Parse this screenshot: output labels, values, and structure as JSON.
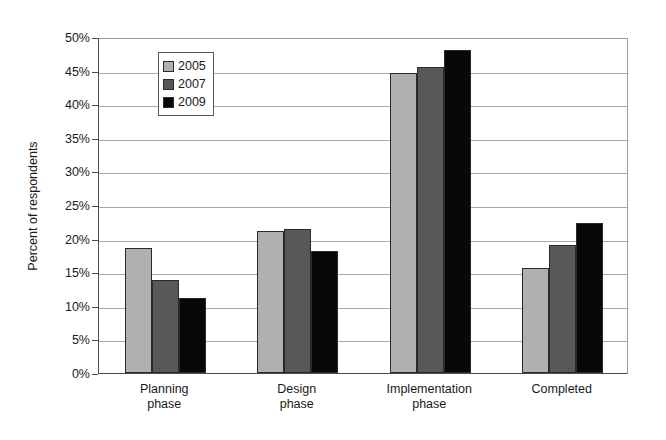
{
  "chart_data": {
    "type": "bar",
    "title": "",
    "xlabel": "",
    "ylabel": "Percent of respondents",
    "categories": [
      "Planning phase",
      "Design phase",
      "Implementation phase",
      "Completed"
    ],
    "category_lines": [
      [
        "Planning",
        "phase"
      ],
      [
        "Design",
        "phase"
      ],
      [
        "Implementation",
        "phase"
      ],
      [
        "Completed",
        ""
      ]
    ],
    "series": [
      {
        "name": "2005",
        "color": "#b0b0b0",
        "values": [
          18.6,
          21.1,
          44.6,
          15.6
        ]
      },
      {
        "name": "2007",
        "color": "#585858",
        "values": [
          13.8,
          21.4,
          45.5,
          19.1
        ]
      },
      {
        "name": "2009",
        "color": "#080808",
        "values": [
          11.2,
          18.2,
          48.0,
          22.3
        ]
      }
    ],
    "ylim": [
      0,
      50
    ],
    "ytick_step": 5,
    "ytick_labels": [
      "0%",
      "5%",
      "10%",
      "15%",
      "20%",
      "25%",
      "30%",
      "35%",
      "40%",
      "45%",
      "50%"
    ],
    "ytick_values": [
      0,
      5,
      10,
      15,
      20,
      25,
      30,
      35,
      40,
      45,
      50
    ],
    "grid": true,
    "legend_position": "upper-left-inside",
    "legend_entries": [
      "2005",
      "2007",
      "2009"
    ]
  }
}
